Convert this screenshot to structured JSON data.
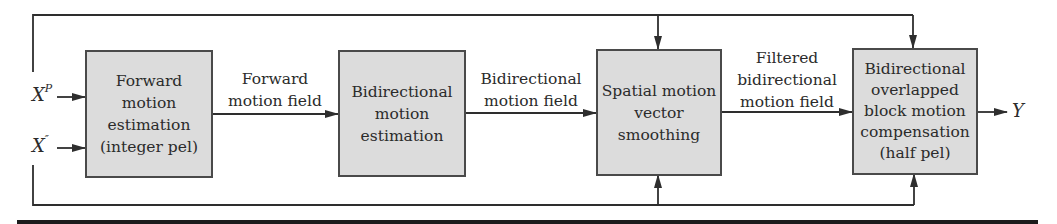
{
  "diagram": {
    "inputs": [
      {
        "symbol": "X",
        "superscript": "P"
      },
      {
        "symbol": "X",
        "superscript": "″"
      }
    ],
    "output": {
      "symbol": "Y"
    },
    "blocks": [
      {
        "id": "forward-me",
        "label": "Forward\nmotion\nestimation\n(integer pel)"
      },
      {
        "id": "bidir-me",
        "label": "Bidirectional\nmotion\nestimation"
      },
      {
        "id": "smoothing",
        "label": "Spatial motion\nvector\nsmoothing"
      },
      {
        "id": "obmc",
        "label": "Bidirectional\noverlapped\nblock motion\ncompensation\n(half pel)"
      }
    ],
    "edges": [
      {
        "from": "forward-me",
        "to": "bidir-me",
        "label": "Forward\nmotion field"
      },
      {
        "from": "bidir-me",
        "to": "smoothing",
        "label": "Bidirectional\nmotion field"
      },
      {
        "from": "smoothing",
        "to": "obmc",
        "label": "Filtered\nbidirectional\nmotion field"
      },
      {
        "from": "obmc",
        "to": "output",
        "label": ""
      },
      {
        "from": "X^P",
        "to": "smoothing",
        "label": "",
        "route": "top feedback"
      },
      {
        "from": "X^P",
        "to": "obmc",
        "label": "",
        "route": "top feedback"
      },
      {
        "from": "X''",
        "to": "smoothing",
        "label": "",
        "route": "bottom feedback"
      },
      {
        "from": "X''",
        "to": "obmc",
        "label": "",
        "route": "bottom feedback"
      }
    ],
    "colors": {
      "line": "#2e2e2e",
      "box_fill": "#dcdcdc",
      "box_border": "#4a4a4a",
      "bar": "#1c1c1c"
    }
  }
}
